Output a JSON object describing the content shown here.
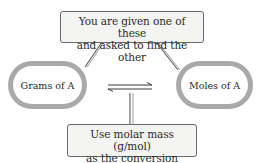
{
  "diagram": {
    "top_callout": {
      "line1": "You are given one of these",
      "line2": "and asked to find the other"
    },
    "left_node": {
      "label": "Grams of A"
    },
    "right_node": {
      "label": "Moles of A"
    },
    "bottom_callout": {
      "line1": "Use molar mass (g/mol)",
      "line2": "as the conversion factor"
    },
    "connector": {
      "type": "equilibrium-arrows"
    },
    "colors": {
      "pill_border": "#a9a9a9",
      "callout_bg": "#f4f4f2",
      "callout_border": "#6a6a6a",
      "text": "#2a2a2a"
    }
  }
}
